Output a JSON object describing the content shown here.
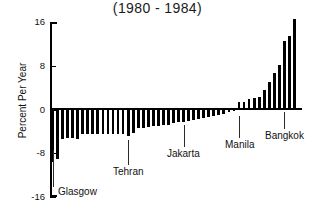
{
  "chart_data": {
    "type": "bar",
    "title": "(1980 - 1984)",
    "xlabel": "",
    "ylabel": "Percent Per Year",
    "ylim": [
      -16,
      16
    ],
    "yticks": [
      16,
      8,
      0,
      -8,
      -16
    ],
    "ytick_labels": [
      "16",
      "8",
      "0",
      "-8",
      "-16"
    ],
    "grid": false,
    "legend": null,
    "bar_color": "#000000",
    "background_color": "#ffffff",
    "categories": [
      "Glasgow",
      "c2",
      "c3",
      "c4",
      "c5",
      "c6",
      "c7",
      "c8",
      "c9",
      "c10",
      "c11",
      "c12",
      "c13",
      "c14",
      "c15",
      "Tehran",
      "c17",
      "c18",
      "c19",
      "c20",
      "c21",
      "c22",
      "c23",
      "c24",
      "c25",
      "c26",
      "Jakarta",
      "c28",
      "c29",
      "c30",
      "c31",
      "c32",
      "c33",
      "c34",
      "c35",
      "c36",
      "c37",
      "Manila",
      "c39",
      "c40",
      "c41",
      "c42",
      "c43",
      "c44",
      "c45",
      "c46",
      "Bangkok",
      "c48",
      "c49",
      "c50"
    ],
    "values": [
      -9.6,
      -9.0,
      -5.4,
      -5.3,
      -5.3,
      -5.4,
      -4.4,
      -4.4,
      -4.4,
      -4.4,
      -4.4,
      -4.4,
      -4.4,
      -4.4,
      -4.4,
      -4.8,
      -4.3,
      -3.4,
      -3.3,
      -3.2,
      -3.1,
      -3.0,
      -2.9,
      -2.8,
      -2.4,
      -2.3,
      -2.2,
      -2.1,
      -2.0,
      -1.8,
      -1.6,
      -1.4,
      -1.2,
      -1.0,
      -0.8,
      -0.5,
      -0.3,
      1.4,
      1.4,
      2.0,
      2.1,
      2.3,
      3.6,
      5.1,
      6.6,
      8.1,
      12.6,
      13.4,
      16.5,
      0
    ],
    "annotations": [
      {
        "label": "Glasgow",
        "bar_index": 0
      },
      {
        "label": "Tehran",
        "bar_index": 15
      },
      {
        "label": "Jakarta",
        "bar_index": 26
      },
      {
        "label": "Manila",
        "bar_index": 37
      },
      {
        "label": "Bangkok",
        "bar_index": 46
      }
    ]
  }
}
